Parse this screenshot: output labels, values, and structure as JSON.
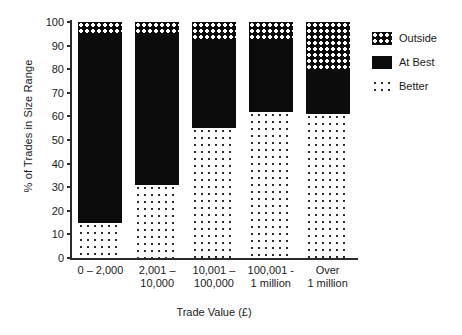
{
  "chart_data": {
    "type": "bar",
    "stacked": true,
    "title": "",
    "xlabel": "Trade Value (£)",
    "ylabel": "% of Trades in Size Range",
    "ylim": [
      0,
      100
    ],
    "yticks": [
      0,
      10,
      20,
      30,
      40,
      50,
      60,
      70,
      80,
      90,
      100
    ],
    "grid": false,
    "legend_position": "right",
    "categories": [
      "0 – 2,000",
      "2,001 –\n10,000",
      "10,001 –\n100,000",
      "100,001 -\n1 million",
      "Over\n1 million"
    ],
    "series": [
      {
        "name": "Better",
        "values": [
          15,
          31,
          55,
          62,
          61
        ]
      },
      {
        "name": "At Best",
        "values": [
          80,
          64,
          37,
          31,
          19
        ]
      },
      {
        "name": "Outside",
        "values": [
          5,
          5,
          8,
          7,
          20
        ]
      }
    ]
  },
  "axes": {
    "y_title": "% of Trades in Size Range",
    "x_title": "Trade Value (£)",
    "y_ticks": [
      "0",
      "10",
      "20",
      "30",
      "40",
      "50",
      "60",
      "70",
      "80",
      "90",
      "100"
    ],
    "x_ticks": [
      {
        "line1": "0 – 2,000",
        "line2": ""
      },
      {
        "line1": "2,001 –",
        "line2": "10,000"
      },
      {
        "line1": "10,001 –",
        "line2": "100,000"
      },
      {
        "line1": "100,001 -",
        "line2": "1 million"
      },
      {
        "line1": "Over",
        "line2": "1 million"
      }
    ]
  },
  "legend": {
    "items": [
      {
        "label": "Outside",
        "swatch": "outside-pattern"
      },
      {
        "label": "At Best",
        "swatch": "solid-black"
      },
      {
        "label": "Better",
        "swatch": "dotted-pattern"
      }
    ]
  },
  "colors": {
    "ink": "#1a1a1a",
    "bar_solid": "#0c0c0c",
    "background": "#ffffff"
  }
}
